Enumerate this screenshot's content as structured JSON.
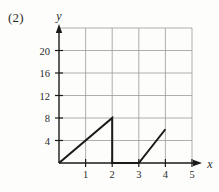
{
  "figure": {
    "problem_label": "(2)"
  },
  "axes": {
    "x_axis_name": "x",
    "y_axis_name": "y",
    "x_ticks": [
      "1",
      "2",
      "3",
      "4",
      "5"
    ],
    "y_ticks": [
      "4",
      "8",
      "12",
      "16",
      "20"
    ]
  },
  "colors": {
    "background": "#fdfdfc",
    "grid": "#9a9a9a",
    "axis": "#1a1a1a",
    "curve": "#1a1a1a",
    "text": "#2b2b2b"
  },
  "chart_data": {
    "type": "line",
    "title": "",
    "xlabel": "x",
    "ylabel": "y",
    "xlim": [
      0,
      5.6
    ],
    "ylim": [
      0,
      24
    ],
    "grid": true,
    "legend": "none",
    "x_tick_values": [
      1,
      2,
      3,
      4,
      5
    ],
    "y_tick_values": [
      4,
      8,
      12,
      16,
      20
    ],
    "x_grid_values": [
      1,
      2,
      3,
      4,
      5
    ],
    "y_grid_values": [
      4,
      8,
      12,
      16,
      20,
      24
    ],
    "series": [
      {
        "name": "piecewise-sawtooth",
        "points": [
          [
            0,
            0
          ],
          [
            2,
            8
          ],
          [
            2,
            0
          ],
          [
            3,
            0
          ],
          [
            4,
            6
          ]
        ]
      }
    ]
  }
}
